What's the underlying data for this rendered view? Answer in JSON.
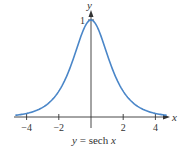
{
  "chart_data": {
    "type": "line",
    "title": "",
    "caption": "y = sech x",
    "caption_parts": {
      "lhs": "y",
      "eq": " = sech ",
      "var": "x"
    },
    "xlabel": "x",
    "ylabel": "y",
    "xlim": [
      -4.8,
      4.8
    ],
    "ylim": [
      0,
      1.1
    ],
    "x_ticks": [
      -4,
      -2,
      2,
      4
    ],
    "x_tick_labels": [
      "−4",
      "−2",
      "2",
      "4"
    ],
    "y_ticks": [
      1
    ],
    "y_tick_labels": [
      "1"
    ],
    "grid": false,
    "legend": null,
    "series": [
      {
        "name": "sech x",
        "color": "#4a86c8",
        "x": [
          -4.7,
          -4,
          -3,
          -2,
          -1.5,
          -1,
          -0.5,
          0,
          0.5,
          1,
          1.5,
          2,
          3,
          4,
          4.7
        ],
        "y": [
          0.018,
          0.037,
          0.099,
          0.266,
          0.425,
          0.648,
          0.887,
          1.0,
          0.887,
          0.648,
          0.425,
          0.266,
          0.099,
          0.037,
          0.018
        ]
      }
    ]
  }
}
